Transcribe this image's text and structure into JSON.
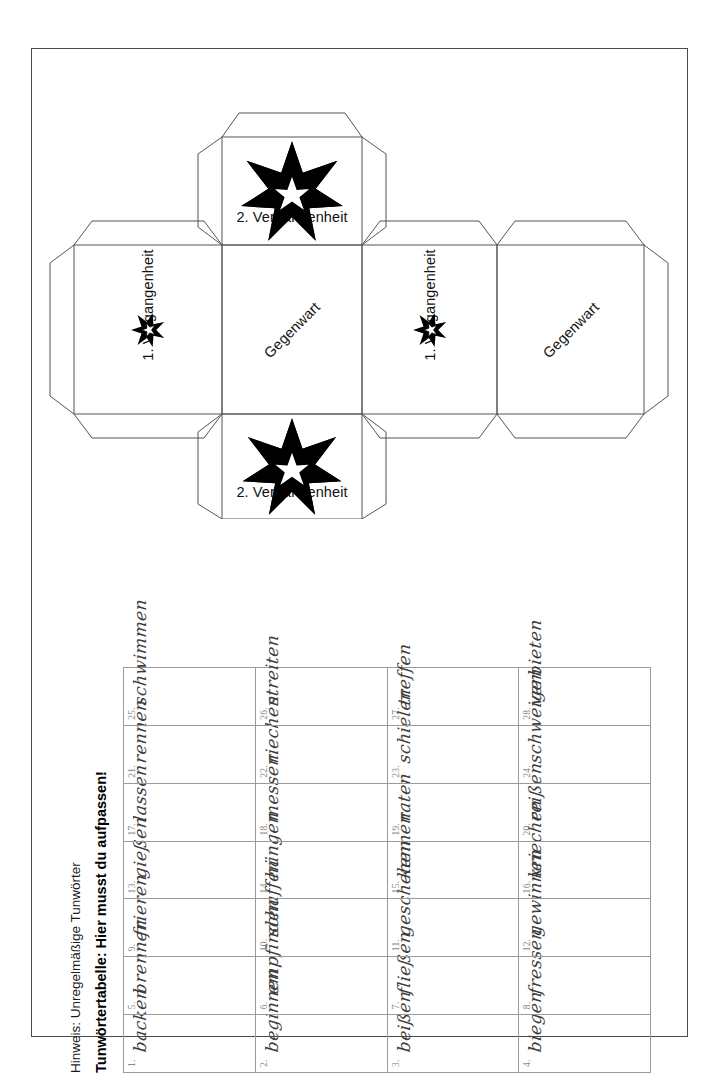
{
  "worksheet": {
    "hint_line": "Hinweis: Unregelmäßige Tunwörter",
    "table_title": "Tunwörtertabelle: Hier musst du aufpassen!"
  },
  "cube_net": {
    "faces": [
      {
        "id": "top",
        "label": "2. Vergangenheit",
        "stars": 2,
        "rotation": "0deg"
      },
      {
        "id": "left",
        "label": "1. Vergangenheit",
        "stars": 1,
        "rotation": "-90deg"
      },
      {
        "id": "center",
        "label": "Gegenwart",
        "stars": 0,
        "rotation": "-45deg"
      },
      {
        "id": "right",
        "label": "1. Vergangenheit",
        "stars": 1,
        "rotation": "-90deg"
      },
      {
        "id": "far-right",
        "label": "Gegenwart",
        "stars": 0,
        "rotation": "-45deg"
      },
      {
        "id": "bottom",
        "label": "2. Vergangenheit",
        "stars": 2,
        "rotation": "0deg"
      }
    ],
    "star_icon": "star-icon",
    "line_color": "#555555"
  },
  "verb_table": {
    "columns": 7,
    "rows": 4,
    "entries": [
      {
        "n": "1.",
        "verb": "backen"
      },
      {
        "n": "2.",
        "verb": "beginnen"
      },
      {
        "n": "3.",
        "verb": "beißen"
      },
      {
        "n": "4.",
        "verb": "biegen"
      },
      {
        "n": "5.",
        "verb": "brennen"
      },
      {
        "n": "6.",
        "verb": "empfinden"
      },
      {
        "n": "7.",
        "verb": "fließen"
      },
      {
        "n": "8.",
        "verb": "fressen"
      },
      {
        "n": "9.",
        "verb": "frieren"
      },
      {
        "n": "10.",
        "verb": "schaffen"
      },
      {
        "n": "11.",
        "verb": "geschehen"
      },
      {
        "n": "12.",
        "verb": "gewinnen"
      },
      {
        "n": "13.",
        "verb": "gießen"
      },
      {
        "n": "14.",
        "verb": "hängen"
      },
      {
        "n": "15.",
        "verb": "kennen"
      },
      {
        "n": "16.",
        "verb": "kriechen"
      },
      {
        "n": "17.",
        "verb": "lassen"
      },
      {
        "n": "18.",
        "verb": "messen"
      },
      {
        "n": "19.",
        "verb": "raten"
      },
      {
        "n": "20.",
        "verb": "reißen"
      },
      {
        "n": "21.",
        "verb": "rennen"
      },
      {
        "n": "22.",
        "verb": "riechen"
      },
      {
        "n": "23.",
        "verb": "schielen"
      },
      {
        "n": "24.",
        "verb": "schweigen"
      },
      {
        "n": "25.",
        "verb": "schwimmen"
      },
      {
        "n": "26.",
        "verb": "streiten"
      },
      {
        "n": "27.",
        "verb": "treffen"
      },
      {
        "n": "28.",
        "verb": "verbieten"
      }
    ]
  }
}
